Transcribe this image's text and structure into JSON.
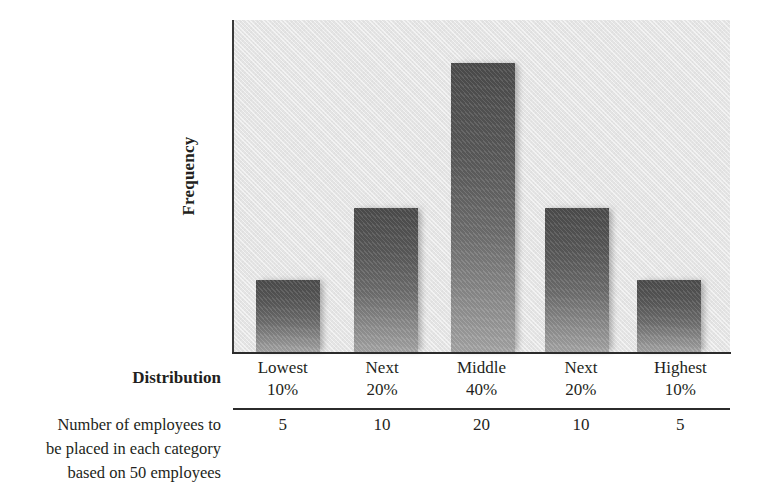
{
  "chart_data": {
    "type": "bar",
    "title": "",
    "xlabel": "Distribution",
    "ylabel": "Frequency",
    "categories": [
      "Lowest 10%",
      "Next 20%",
      "Middle 40%",
      "Next 20%",
      "Highest 10%"
    ],
    "category_names": [
      "Lowest",
      "Next",
      "Middle",
      "Next",
      "Highest"
    ],
    "category_percents": [
      "10%",
      "20%",
      "40%",
      "20%",
      "10%"
    ],
    "values": [
      5,
      10,
      20,
      10,
      5
    ],
    "ylim": [
      0,
      23
    ],
    "grid": false,
    "legend": null,
    "bar_color_top": "#4d4d4d",
    "bar_color_bottom": "#a6a6a6",
    "plot_background": "#e4e4e4",
    "axis_color": "#2b2b2b"
  },
  "axes": {
    "y_title": "Frequency",
    "x_title": "Distribution"
  },
  "table": {
    "distribution_label": "Distribution",
    "columns": [
      {
        "name": "Lowest",
        "percent": "10%",
        "count": "5"
      },
      {
        "name": "Next",
        "percent": "20%",
        "count": "10"
      },
      {
        "name": "Middle",
        "percent": "40%",
        "count": "20"
      },
      {
        "name": "Next",
        "percent": "20%",
        "count": "10"
      },
      {
        "name": "Highest",
        "percent": "10%",
        "count": "5"
      }
    ],
    "count_row_label": {
      "line1": "Number of employees to",
      "line2": "be placed in each category",
      "line3": "based on 50 employees"
    }
  }
}
